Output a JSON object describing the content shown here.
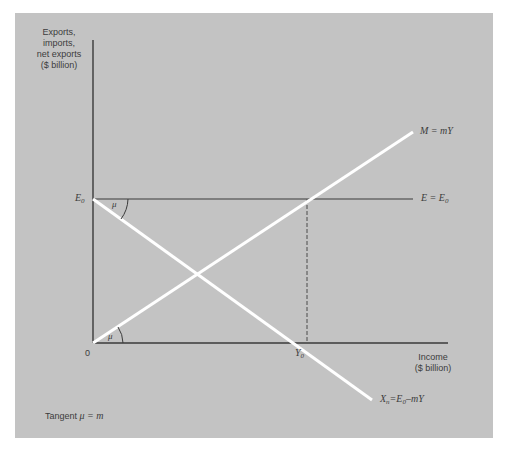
{
  "figure": {
    "background_color": "#c3c3c3",
    "page_color": "#ffffff",
    "axis_color": "#3a3a3a",
    "curve_color": "#ffffff"
  },
  "y_axis": {
    "label_line1": "Exports,",
    "label_line2": "imports,",
    "label_line3": "net exports",
    "label_line4": "($ billion)",
    "tick_E0_main": "E",
    "tick_E0_sub": "0"
  },
  "x_axis": {
    "label_line1": "Income",
    "label_line2": "($ billion)",
    "origin": "0",
    "tick_Y0_main": "Y",
    "tick_Y0_sub": "0"
  },
  "lines": {
    "imports": {
      "label_main": "M = mY"
    },
    "exports": {
      "label_main": "E = E",
      "label_sub": "0"
    },
    "net_exports": {
      "label_a": "X",
      "label_a_sub": "n",
      "label_b": "=E",
      "label_b_sub": "0",
      "label_c": "–mY"
    }
  },
  "angles": {
    "top": "μ",
    "bottom": "μ"
  },
  "note": {
    "prefix": "Tangent ",
    "mu": "μ",
    "suffix": " = m"
  }
}
